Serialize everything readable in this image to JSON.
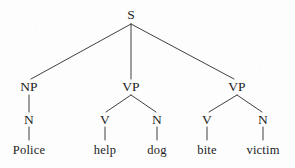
{
  "diagram": {
    "type": "constituency-syntax-tree",
    "sentence": "Police help dog bite victim",
    "ink_color": "#2b2b2b",
    "background_color": "#fdfdfd",
    "nodes": [
      {
        "id": "s",
        "label": "S",
        "x": 131,
        "y": 15,
        "level": "root"
      },
      {
        "id": "np",
        "label": "NP",
        "x": 29,
        "y": 87,
        "level": "phrase"
      },
      {
        "id": "vp1",
        "label": "VP",
        "x": 131,
        "y": 87,
        "level": "phrase"
      },
      {
        "id": "vp2",
        "label": "VP",
        "x": 237,
        "y": 87,
        "level": "phrase"
      },
      {
        "id": "n1",
        "label": "N",
        "x": 29,
        "y": 120,
        "level": "pos"
      },
      {
        "id": "v1",
        "label": "V",
        "x": 105,
        "y": 120,
        "level": "pos"
      },
      {
        "id": "n2",
        "label": "N",
        "x": 157,
        "y": 120,
        "level": "pos"
      },
      {
        "id": "v2",
        "label": "V",
        "x": 207,
        "y": 120,
        "level": "pos"
      },
      {
        "id": "n3",
        "label": "N",
        "x": 263,
        "y": 120,
        "level": "pos"
      },
      {
        "id": "w-police",
        "label": "Police",
        "x": 29,
        "y": 150,
        "level": "word"
      },
      {
        "id": "w-help",
        "label": "help",
        "x": 105,
        "y": 150,
        "level": "word"
      },
      {
        "id": "w-dog",
        "label": "dog",
        "x": 157,
        "y": 150,
        "level": "word"
      },
      {
        "id": "w-bite",
        "label": "bite",
        "x": 207,
        "y": 150,
        "level": "word"
      },
      {
        "id": "w-victim",
        "label": "victim",
        "x": 263,
        "y": 150,
        "level": "word"
      }
    ],
    "edges": [
      {
        "from": "s",
        "to": "np",
        "x1": 131,
        "y1": 24,
        "x2": 31,
        "y2": 79
      },
      {
        "from": "s",
        "to": "vp1",
        "x1": 131,
        "y1": 24,
        "x2": 131,
        "y2": 79
      },
      {
        "from": "s",
        "to": "vp2",
        "x1": 131,
        "y1": 24,
        "x2": 234,
        "y2": 79
      },
      {
        "from": "np",
        "to": "n1",
        "x1": 29,
        "y1": 95,
        "x2": 29,
        "y2": 112
      },
      {
        "from": "vp1",
        "to": "v1",
        "x1": 131,
        "y1": 95,
        "x2": 106,
        "y2": 112
      },
      {
        "from": "vp1",
        "to": "n2",
        "x1": 131,
        "y1": 95,
        "x2": 156,
        "y2": 112
      },
      {
        "from": "vp2",
        "to": "v2",
        "x1": 237,
        "y1": 95,
        "x2": 209,
        "y2": 112
      },
      {
        "from": "vp2",
        "to": "n3",
        "x1": 237,
        "y1": 95,
        "x2": 262,
        "y2": 112
      },
      {
        "from": "n1",
        "to": "w-police",
        "x1": 29,
        "y1": 127,
        "x2": 29,
        "y2": 140
      },
      {
        "from": "v1",
        "to": "w-help",
        "x1": 105,
        "y1": 127,
        "x2": 105,
        "y2": 140
      },
      {
        "from": "n2",
        "to": "w-dog",
        "x1": 157,
        "y1": 127,
        "x2": 157,
        "y2": 140
      },
      {
        "from": "v2",
        "to": "w-bite",
        "x1": 207,
        "y1": 127,
        "x2": 207,
        "y2": 140
      },
      {
        "from": "n3",
        "to": "w-victim",
        "x1": 263,
        "y1": 127,
        "x2": 263,
        "y2": 140
      }
    ]
  }
}
